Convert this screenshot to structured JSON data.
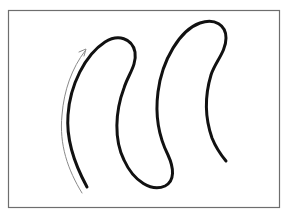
{
  "diagram": {
    "type": "curve-with-direction-arrow",
    "elements": [
      {
        "name": "frame",
        "shape": "rectangle-border",
        "color": "#6e6e6e"
      },
      {
        "name": "wavy-curve",
        "shape": "serpentine-path",
        "color": "#111111",
        "stroke_width": 3
      },
      {
        "name": "direction-arrow",
        "shape": "curved-arrow",
        "direction": "upward",
        "color": "#8a8a8a",
        "stroke_width": 1
      }
    ],
    "labels": []
  },
  "colors": {
    "background": "#ffffff",
    "frame": "#6e6e6e",
    "curve": "#111111",
    "arrow": "#8a8a8a"
  }
}
